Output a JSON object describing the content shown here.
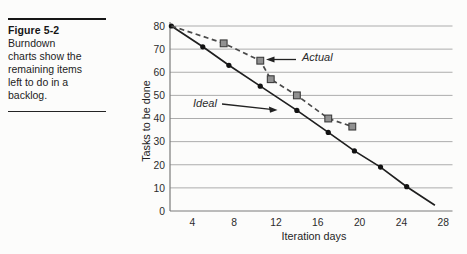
{
  "figure": {
    "title": "Figure 5-2",
    "caption_lines": [
      "Burndown",
      "charts show the",
      "remaining items",
      "left to do in a",
      "backlog."
    ]
  },
  "chart_data": {
    "type": "line",
    "title": "",
    "xlabel": "Iteration days",
    "ylabel": "Tasks to be done",
    "xlim": [
      2,
      29
    ],
    "ylim": [
      0,
      80
    ],
    "x_ticks": [
      4,
      8,
      12,
      16,
      20,
      24,
      28
    ],
    "y_ticks": [
      0,
      10,
      20,
      30,
      40,
      50,
      60,
      70,
      80
    ],
    "grid": "horizontal",
    "legend_position": "inline-annotations",
    "series": [
      {
        "name": "Ideal",
        "style": "solid",
        "marker": "dot",
        "color": "#1f1f1f",
        "points": [
          [
            2,
            80
          ],
          [
            5,
            71
          ],
          [
            7.5,
            63
          ],
          [
            10.5,
            54
          ],
          [
            14,
            43.5
          ],
          [
            17,
            34
          ],
          [
            19.5,
            26
          ],
          [
            22,
            19
          ],
          [
            24.5,
            10.5
          ]
        ],
        "line_end": [
          27.2,
          2.5
        ]
      },
      {
        "name": "Actual",
        "style": "dashed",
        "marker": "square",
        "color": "#4a4a4a",
        "marker_skip_first": true,
        "points": [
          [
            2,
            80
          ],
          [
            7,
            72.5
          ],
          [
            10.5,
            65
          ],
          [
            11.5,
            57
          ],
          [
            14,
            50
          ],
          [
            17,
            40
          ],
          [
            19.3,
            36.5
          ]
        ]
      }
    ],
    "annotations": {
      "actual": {
        "label": "Actual"
      },
      "ideal": {
        "label": "Ideal"
      }
    }
  }
}
